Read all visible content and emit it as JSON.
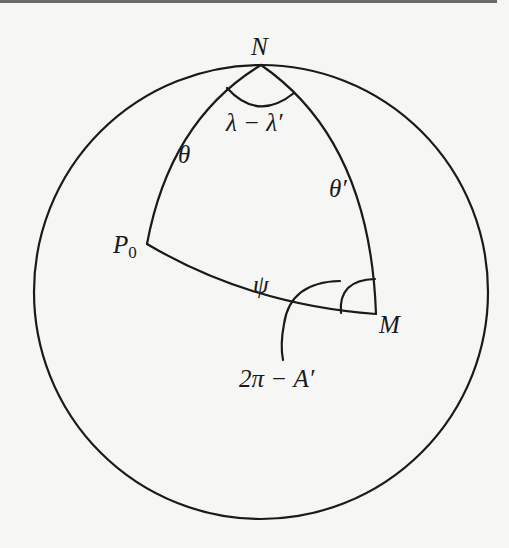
{
  "figure": {
    "type": "spherical-triangle-diagram",
    "colors": {
      "background": "#f6f6f4",
      "stroke": "#1a1a1a",
      "top_bar": "#6a6a6a"
    },
    "vertices": {
      "north_pole": {
        "label": "N",
        "x": 261,
        "y": 65
      },
      "p0": {
        "label": "P",
        "subscript": "0",
        "x": 147,
        "y": 244
      },
      "m": {
        "label": "M",
        "x": 376,
        "y": 314
      }
    },
    "sides": {
      "theta": {
        "label": "θ"
      },
      "theta_prime": {
        "label": "θ′"
      },
      "psi": {
        "label": "ψ"
      }
    },
    "angles": {
      "at_n": {
        "label": "λ − λ′"
      },
      "at_m": {
        "label": "2π − A′"
      }
    },
    "sphere": {
      "cx": 261,
      "cy": 292,
      "r": 227
    }
  }
}
